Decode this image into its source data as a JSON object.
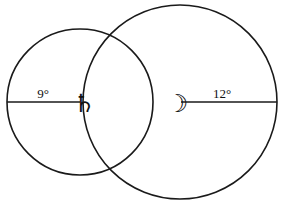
{
  "diagram": {
    "background_color": "#ffffff",
    "stroke_color": "#1a1a1a",
    "circles": [
      {
        "id": "left-circle",
        "label": "9°",
        "glyph": "♄",
        "glyph_name": "saturn-symbol",
        "cx": 80,
        "cy": 102,
        "r": 73,
        "radius_line": {
          "x1": 7,
          "y1": 102,
          "x2": 80,
          "y2": 102
        },
        "label_x": 43,
        "label_y": 98,
        "glyph_x": 73,
        "glyph_y": 112
      },
      {
        "id": "right-circle",
        "label": "12°",
        "glyph": "☽",
        "glyph_name": "moon-symbol",
        "cx": 180,
        "cy": 102,
        "r": 97,
        "radius_line": {
          "x1": 181,
          "y1": 102,
          "x2": 277,
          "y2": 102
        },
        "label_x": 222,
        "label_y": 98,
        "glyph_x": 166,
        "glyph_y": 112
      }
    ]
  }
}
